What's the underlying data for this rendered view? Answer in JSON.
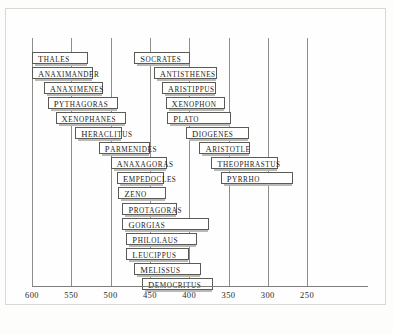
{
  "chart_data": {
    "type": "bar",
    "orientation": "horizontal",
    "title": "",
    "xlabel": "",
    "ylabel": "",
    "axis_direction": "descending",
    "xlim": [
      610,
      240
    ],
    "grid": true,
    "legend": "none",
    "tick_labels": [
      "600",
      "550",
      "500",
      "450",
      "400",
      "350",
      "300",
      "250"
    ],
    "ticks": [
      600,
      550,
      500,
      450,
      400,
      350,
      300,
      250
    ],
    "categories": [
      "Thales",
      "Anaximander",
      "Anaximenes",
      "Pythagoras",
      "Xenophanes",
      "Heraclitus",
      "Parmenides",
      "Anaxagoras",
      "Empedocles",
      "Zeno",
      "Protagoras",
      "Gorgias",
      "Philolaus",
      "Leucippus",
      "Melissus",
      "Democritus",
      "Socrates",
      "Antisthenes",
      "Aristippus",
      "Xenophon",
      "Plato",
      "Diogenes",
      "Aristotle",
      "Theophrastus",
      "Pyrrho"
    ],
    "bars": [
      {
        "label": "Thales",
        "start": 600,
        "end": 529,
        "row": 0,
        "column": "left"
      },
      {
        "label": "Anaximander",
        "start": 600,
        "end": 523,
        "row": 1,
        "column": "left"
      },
      {
        "label": "Anaximenes",
        "start": 585,
        "end": 510,
        "row": 2,
        "column": "left"
      },
      {
        "label": "Pythagoras",
        "start": 580,
        "end": 490,
        "row": 3,
        "column": "left"
      },
      {
        "label": "Xenophanes",
        "start": 570,
        "end": 480,
        "row": 4,
        "column": "left"
      },
      {
        "label": "Heraclitus",
        "start": 545,
        "end": 485,
        "row": 5,
        "column": "left"
      },
      {
        "label": "Parmenides",
        "start": 515,
        "end": 450,
        "row": 6,
        "column": "left"
      },
      {
        "label": "Anaxagoras",
        "start": 500,
        "end": 428,
        "row": 7,
        "column": "left"
      },
      {
        "label": "Empedocles",
        "start": 492,
        "end": 432,
        "row": 8,
        "column": "left"
      },
      {
        "label": "Zeno",
        "start": 490,
        "end": 430,
        "row": 9,
        "column": "left"
      },
      {
        "label": "Protagoras",
        "start": 485,
        "end": 415,
        "row": 10,
        "column": "left"
      },
      {
        "label": "Gorgias",
        "start": 485,
        "end": 375,
        "row": 11,
        "column": "left"
      },
      {
        "label": "Philolaus",
        "start": 480,
        "end": 390,
        "row": 12,
        "column": "left"
      },
      {
        "label": "Leucippus",
        "start": 480,
        "end": 400,
        "row": 13,
        "column": "left"
      },
      {
        "label": "Melissus",
        "start": 470,
        "end": 385,
        "row": 14,
        "column": "left"
      },
      {
        "label": "Democritus",
        "start": 460,
        "end": 370,
        "row": 15,
        "column": "left"
      },
      {
        "label": "Socrates",
        "start": 470,
        "end": 399,
        "row": 0,
        "column": "right"
      },
      {
        "label": "Antisthenes",
        "start": 445,
        "end": 365,
        "row": 1,
        "column": "right"
      },
      {
        "label": "Aristippus",
        "start": 435,
        "end": 366,
        "row": 2,
        "column": "right"
      },
      {
        "label": "Xenophon",
        "start": 430,
        "end": 355,
        "row": 3,
        "column": "right"
      },
      {
        "label": "Plato",
        "start": 428,
        "end": 347,
        "row": 4,
        "column": "right"
      },
      {
        "label": "Diogenes",
        "start": 404,
        "end": 324,
        "row": 5,
        "column": "right"
      },
      {
        "label": "Aristotle",
        "start": 387,
        "end": 322,
        "row": 6,
        "column": "right"
      },
      {
        "label": "Theophrastus",
        "start": 372,
        "end": 287,
        "row": 7,
        "column": "right"
      },
      {
        "label": "Pyrrho",
        "start": 360,
        "end": 268,
        "row": 8,
        "column": "right"
      }
    ]
  },
  "caption": ""
}
